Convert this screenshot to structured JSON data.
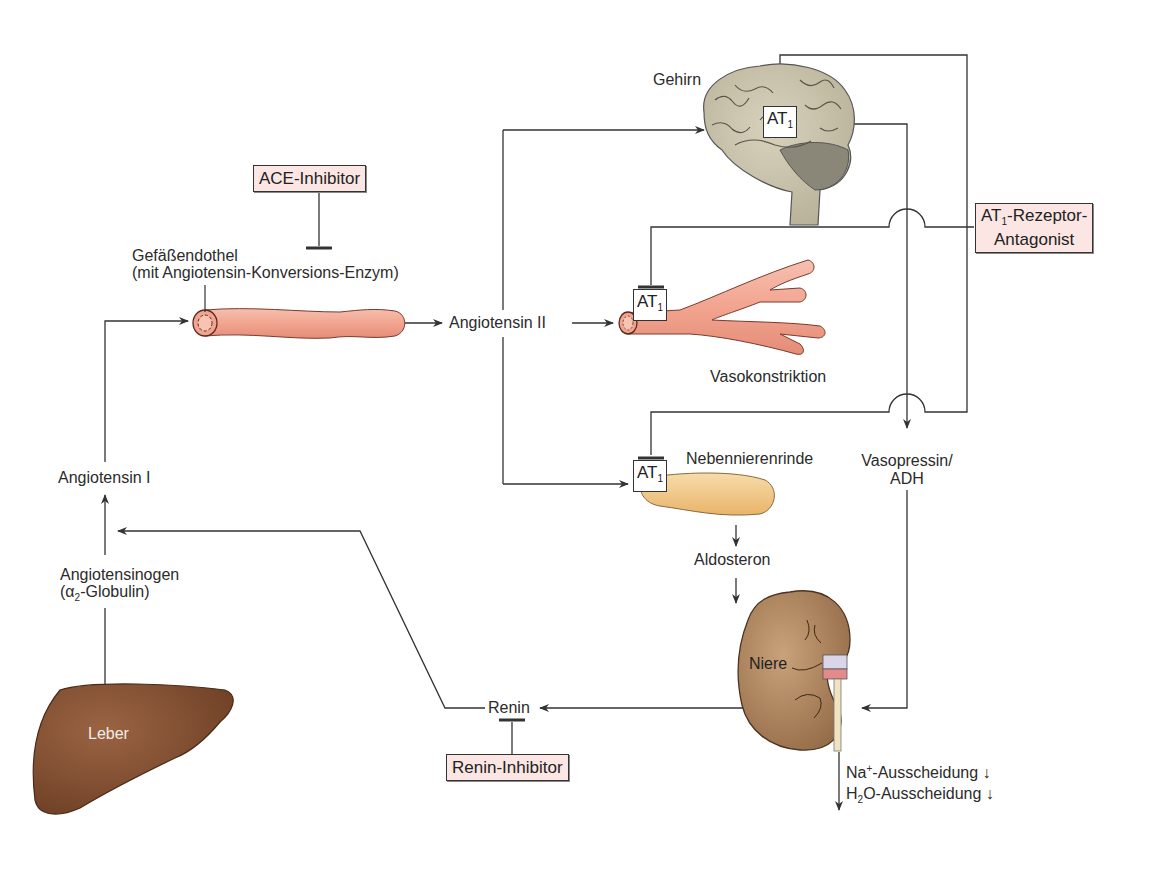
{
  "diagram": {
    "type": "renin-angiotensin-aldosterone-system",
    "colors": {
      "line": "#333333",
      "drug_box_fill": "#fbe6e3",
      "vessel": "#f0a38e",
      "brain": "#c9c2aa",
      "adrenal": "#f2c98a",
      "kidney": "#a8805a",
      "liver": "#7a4a2c"
    },
    "organs": {
      "brain": "Gehirn",
      "vessel_endothelium_line1": "Gefäßendothel",
      "vessel_endothelium_line2": "(mit Angiotensin-Konversions-Enzym)",
      "adrenal_cortex": "Nebennierenrinde",
      "kidney": "Niere",
      "liver": "Leber"
    },
    "substances": {
      "angiotensin_ii": "Angiotensin II",
      "angiotensin_i": "Angiotensin I",
      "angiotensinogen_line1": "Angiotensinogen",
      "angiotensinogen_line2_prefix": "(α",
      "angiotensinogen_line2_sub": "2",
      "angiotensinogen_line2_suffix": "-Globulin)",
      "aldosterone": "Aldosteron",
      "vasopressin_line1": "Vasopressin/",
      "vasopressin_line2": "ADH",
      "renin": "Renin"
    },
    "effects": {
      "vasoconstriction": "Vasokonstriktion",
      "sodium_prefix": "Na",
      "sodium_sup": "+",
      "sodium_suffix": "-Ausscheidung ↓",
      "water_prefix": "H",
      "water_sub": "2",
      "water_suffix": "O-Ausscheidung ↓"
    },
    "receptors": {
      "at1_main": "AT",
      "at1_sub": "1"
    },
    "drugs": {
      "ace_inhibitor": "ACE-Inhibitor",
      "renin_inhibitor": "Renin-Inhibitor",
      "at1_antagonist_prefix": "AT",
      "at1_antagonist_sub": "1",
      "at1_antagonist_line1_suffix": "-Rezeptor-",
      "at1_antagonist_line2": "Antagonist"
    }
  }
}
